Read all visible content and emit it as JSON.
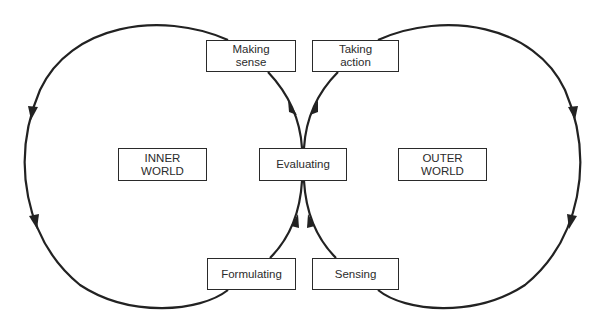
{
  "diagram": {
    "type": "double-loop cycle diagram",
    "line_color": "#222222",
    "nodes": {
      "making_sense": "Making\nsense",
      "taking_action": "Taking\naction",
      "evaluating": "Evaluating",
      "formulating": "Formulating",
      "sensing": "Sensing",
      "inner_world": "INNER\nWORLD",
      "outer_world": "OUTER\nWORLD"
    },
    "loops": [
      {
        "name": "inner-world-loop",
        "path": [
          "Evaluating",
          "Making sense",
          "Formulating",
          "Evaluating"
        ],
        "direction": "counter-clockwise on left"
      },
      {
        "name": "outer-world-loop",
        "path": [
          "Evaluating",
          "Taking action",
          "Sensing",
          "Evaluating"
        ],
        "direction": "clockwise on right"
      }
    ]
  }
}
